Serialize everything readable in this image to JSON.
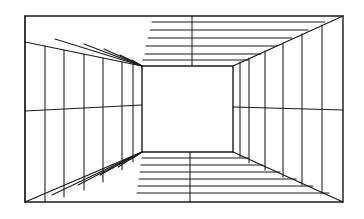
{
  "figure": {
    "type": "line-drawing",
    "width": 364,
    "height": 219,
    "background_color": "#ffffff",
    "stroke_color": "#1a1a1a",
    "stroke_width": 1.1,
    "stroke_width_outline": 1.4
  },
  "geometry": {
    "outer_rect": {
      "name": "outer-frame",
      "top_left": {
        "x": 25,
        "y": 16
      },
      "top_right": {
        "x": 343,
        "y": 16
      },
      "bottom_right": {
        "x": 343,
        "y": 202
      },
      "bottom_left": {
        "x": 25,
        "y": 202
      }
    },
    "inner_rect": {
      "name": "back-wall",
      "top_left": {
        "x": 142,
        "y": 66
      },
      "top_right": {
        "x": 233,
        "y": 66
      },
      "bottom_right": {
        "x": 233,
        "y": 152
      },
      "bottom_left": {
        "x": 142,
        "y": 152
      }
    },
    "left_wall_offset_top": {
      "x": 25,
      "y": 42
    },
    "left_wall_offset_bottom": {
      "x": 25,
      "y": 202
    },
    "ceiling_front_edge_left": {
      "x": 25,
      "y": 42
    },
    "ceiling_break_x": 152,
    "diagonals": [
      {
        "name": "diagonal-top-left",
        "x1": 25,
        "y1": 42,
        "x2": 142,
        "y2": 66
      },
      {
        "name": "diagonal-top-right",
        "x1": 343,
        "y1": 16,
        "x2": 233,
        "y2": 66
      },
      {
        "name": "diagonal-bottom-right",
        "x1": 343,
        "y1": 202,
        "x2": 233,
        "y2": 152
      },
      {
        "name": "diagonal-bottom-left",
        "x1": 25,
        "y1": 202,
        "x2": 142,
        "y2": 152
      }
    ],
    "ceiling": {
      "name": "ceiling-panel",
      "horizontal_lines_right": [
        {
          "x1": 152,
          "y1": 22,
          "x2": 325,
          "y2": 22
        },
        {
          "x1": 150,
          "y1": 30,
          "x2": 308,
          "y2": 30
        },
        {
          "x1": 148,
          "y1": 38,
          "x2": 292,
          "y2": 38
        },
        {
          "x1": 146,
          "y1": 46,
          "x2": 277,
          "y2": 46
        },
        {
          "x1": 145,
          "y1": 54,
          "x2": 261,
          "y2": 54
        },
        {
          "x1": 143,
          "y1": 60,
          "x2": 248,
          "y2": 60
        }
      ],
      "fan_lines_left": [
        {
          "x1": 142,
          "y1": 66,
          "x2": 55,
          "y2": 39
        },
        {
          "x1": 142,
          "y1": 66,
          "x2": 84,
          "y2": 44
        },
        {
          "x1": 142,
          "y1": 66,
          "x2": 104,
          "y2": 49
        },
        {
          "x1": 142,
          "y1": 66,
          "x2": 120,
          "y2": 55
        },
        {
          "x1": 142,
          "y1": 66,
          "x2": 132,
          "y2": 60
        }
      ],
      "vertical_divider": {
        "x1": 192,
        "y1": 16,
        "x2": 192,
        "y2": 66
      }
    },
    "floor": {
      "name": "floor-panel",
      "horizontal_lines_right": [
        {
          "x1": 142,
          "y1": 158,
          "x2": 248,
          "y2": 158
        },
        {
          "x1": 141,
          "y1": 165,
          "x2": 263,
          "y2": 165
        },
        {
          "x1": 140,
          "y1": 172,
          "x2": 280,
          "y2": 172
        },
        {
          "x1": 139,
          "y1": 179,
          "x2": 296,
          "y2": 179
        },
        {
          "x1": 138,
          "y1": 186,
          "x2": 313,
          "y2": 186
        },
        {
          "x1": 137,
          "y1": 193,
          "x2": 329,
          "y2": 193
        }
      ],
      "fan_lines_left": [
        {
          "x1": 142,
          "y1": 152,
          "x2": 131,
          "y2": 159
        },
        {
          "x1": 142,
          "y1": 152,
          "x2": 118,
          "y2": 167
        },
        {
          "x1": 142,
          "y1": 152,
          "x2": 100,
          "y2": 175
        },
        {
          "x1": 142,
          "y1": 152,
          "x2": 78,
          "y2": 185
        },
        {
          "x1": 142,
          "y1": 152,
          "x2": 52,
          "y2": 195
        }
      ],
      "vertical_divider": {
        "x1": 190,
        "y1": 152,
        "x2": 190,
        "y2": 202
      }
    },
    "left_wall": {
      "name": "left-wall-panel",
      "vertical_lines": [
        {
          "x1": 45,
          "y1": 46,
          "x2": 45,
          "y2": 202
        },
        {
          "x1": 64,
          "y1": 50,
          "x2": 64,
          "y2": 197
        },
        {
          "x1": 84,
          "y1": 54,
          "x2": 84,
          "y2": 190
        },
        {
          "x1": 103,
          "y1": 58,
          "x2": 103,
          "y2": 182
        },
        {
          "x1": 122,
          "y1": 62,
          "x2": 122,
          "y2": 170
        },
        {
          "x1": 133,
          "y1": 64,
          "x2": 133,
          "y2": 162
        }
      ],
      "horizontal_line": {
        "x1": 25,
        "y1": 111,
        "x2": 142,
        "y2": 105
      }
    },
    "right_wall": {
      "name": "right-wall-panel",
      "vertical_lines": [
        {
          "x1": 322,
          "y1": 25,
          "x2": 322,
          "y2": 193
        },
        {
          "x1": 302,
          "y1": 34,
          "x2": 302,
          "y2": 185
        },
        {
          "x1": 283,
          "y1": 43,
          "x2": 283,
          "y2": 177
        },
        {
          "x1": 265,
          "y1": 51,
          "x2": 265,
          "y2": 170
        },
        {
          "x1": 249,
          "y1": 58,
          "x2": 249,
          "y2": 163
        },
        {
          "x1": 240,
          "y1": 62,
          "x2": 240,
          "y2": 157
        }
      ],
      "horizontal_line": {
        "x1": 233,
        "y1": 107,
        "x2": 343,
        "y2": 110
      }
    }
  }
}
